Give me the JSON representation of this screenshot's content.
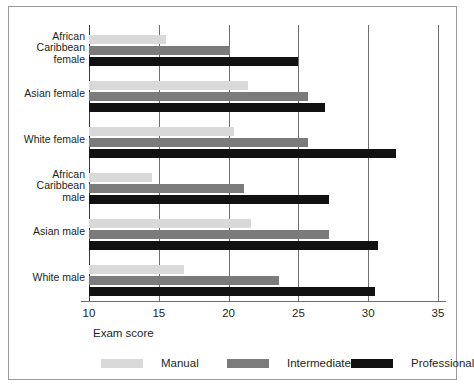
{
  "chart_data": {
    "type": "bar",
    "orientation": "horizontal",
    "title": "",
    "xlabel": "Exam score",
    "ylabel": "",
    "xlim": [
      10,
      35
    ],
    "xticks": [
      10,
      15,
      20,
      25,
      30,
      35
    ],
    "grid": true,
    "legend_position": "bottom",
    "categories": [
      "African\nCaribbean\nfemale",
      "Asian female",
      "White female",
      "African\nCaribbean\nmale",
      "Asian male",
      "White male"
    ],
    "series": [
      {
        "name": "Manual",
        "color": "#d9d9d9",
        "values": [
          15.5,
          21.4,
          20.4,
          14.5,
          21.6,
          16.8
        ]
      },
      {
        "name": "Intermediate",
        "color": "#7b7b7b",
        "values": [
          20.1,
          25.7,
          25.7,
          21.1,
          27.2,
          23.6
        ]
      },
      {
        "name": "Professional",
        "color": "#111111",
        "values": [
          25.0,
          26.9,
          32.0,
          27.2,
          30.7,
          30.5
        ]
      }
    ]
  },
  "axis": {
    "tick_labels": [
      "10",
      "15",
      "20",
      "25",
      "30",
      "35"
    ],
    "x_title": "Exam score"
  },
  "legend": {
    "items": [
      {
        "label": "Manual"
      },
      {
        "label": "Intermediate"
      },
      {
        "label": "Professional"
      }
    ]
  },
  "colors": {
    "manual": "#d9d9d9",
    "intermediate": "#7b7b7b",
    "professional": "#111111",
    "grid": "#6f6f6f",
    "frame": "#9a9a9a",
    "text": "#231f20"
  }
}
